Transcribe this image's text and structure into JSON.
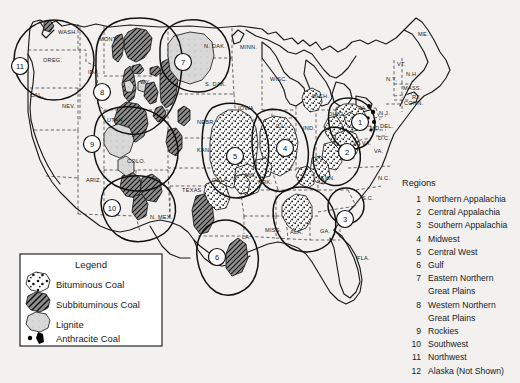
{
  "figure": {
    "kind": "coal-fields-map",
    "background_color": "#f2f1ef",
    "ink_color": "#1a1a1a"
  },
  "legend": {
    "title": "Legend",
    "items": [
      {
        "label": "Bituminous Coal",
        "swatch": "bituminous-stipple",
        "fill_color": "#ffffff"
      },
      {
        "label": "Subbituminous Coal",
        "swatch": "subbituminous-hatch",
        "fill_color": "#8c8c8c"
      },
      {
        "label": "Lignite",
        "swatch": "lignite-light",
        "fill_color": "#d6d6d6"
      },
      {
        "label": "Anthracite Coal",
        "swatch": "anthracite-dots",
        "fill_color": "#000000"
      }
    ]
  },
  "regions": {
    "title": "Regions",
    "items": [
      {
        "number": "1",
        "name": "Northern Appalachia"
      },
      {
        "number": "2",
        "name": "Central Appalachia"
      },
      {
        "number": "3",
        "name": "Southern Appalachia"
      },
      {
        "number": "4",
        "name": "Midwest"
      },
      {
        "number": "5",
        "name": "Central West"
      },
      {
        "number": "6",
        "name": "Gulf"
      },
      {
        "number": "7",
        "name": "Eastern Northern"
      },
      {
        "number": "",
        "name": "Great Plains"
      },
      {
        "number": "8",
        "name": "Western Northern"
      },
      {
        "number": "",
        "name": "Great Plains"
      },
      {
        "number": "9",
        "name": "Rockies"
      },
      {
        "number": "10",
        "name": "Southwest"
      },
      {
        "number": "11",
        "name": "Northwest"
      },
      {
        "number": "12",
        "name": "Alaska (Not Shown)"
      }
    ]
  },
  "map_badges": [
    {
      "label": "11",
      "x": 20,
      "y": 66
    },
    {
      "label": "7",
      "x": 183,
      "y": 62
    },
    {
      "label": "8",
      "x": 102,
      "y": 92
    },
    {
      "label": "1",
      "x": 360,
      "y": 122
    },
    {
      "label": "9",
      "x": 92,
      "y": 144
    },
    {
      "label": "2",
      "x": 347,
      "y": 152
    },
    {
      "label": "5",
      "x": 235,
      "y": 156
    },
    {
      "label": "4",
      "x": 285,
      "y": 148
    },
    {
      "label": "10",
      "x": 112,
      "y": 208
    },
    {
      "label": "3",
      "x": 345,
      "y": 219
    },
    {
      "label": "6",
      "x": 217,
      "y": 257
    }
  ],
  "state_labels": [
    {
      "text": "WASH.",
      "x": 58,
      "y": 34
    },
    {
      "text": "OREG.",
      "x": 43,
      "y": 62
    },
    {
      "text": "MONT.",
      "x": 99,
      "y": 41
    },
    {
      "text": "N. DAK.",
      "x": 204,
      "y": 48
    },
    {
      "text": "MINN.",
      "x": 240,
      "y": 49
    },
    {
      "text": "ME.",
      "x": 418,
      "y": 36
    },
    {
      "text": "IDA.",
      "x": 88,
      "y": 74
    },
    {
      "text": "S. DAK.",
      "x": 205,
      "y": 86
    },
    {
      "text": "WISC.",
      "x": 270,
      "y": 81
    },
    {
      "text": "N.Y.",
      "x": 386,
      "y": 81
    },
    {
      "text": "VT.",
      "x": 397,
      "y": 66
    },
    {
      "text": "N.H.",
      "x": 406,
      "y": 76
    },
    {
      "text": "MASS.",
      "x": 403,
      "y": 90
    },
    {
      "text": "R.I.",
      "x": 412,
      "y": 99
    },
    {
      "text": "CAL.",
      "x": 30,
      "y": 97
    },
    {
      "text": "NEV.",
      "x": 62,
      "y": 108
    },
    {
      "text": "WY.",
      "x": 140,
      "y": 84
    },
    {
      "text": "IOWA",
      "x": 238,
      "y": 110
    },
    {
      "text": "MICH.",
      "x": 312,
      "y": 98
    },
    {
      "text": "OHIO",
      "x": 328,
      "y": 116
    },
    {
      "text": "PA.",
      "x": 358,
      "y": 110
    },
    {
      "text": "CONN.",
      "x": 404,
      "y": 105
    },
    {
      "text": "N.J.",
      "x": 379,
      "y": 115
    },
    {
      "text": "UTAH",
      "x": 107,
      "y": 122
    },
    {
      "text": "NEBR.",
      "x": 197,
      "y": 124
    },
    {
      "text": "ILL.",
      "x": 276,
      "y": 128
    },
    {
      "text": "IND.",
      "x": 303,
      "y": 130
    },
    {
      "text": "MD.",
      "x": 370,
      "y": 130
    },
    {
      "text": "DEL.",
      "x": 380,
      "y": 128
    },
    {
      "text": "D.C.",
      "x": 378,
      "y": 140
    },
    {
      "text": "W. VA.",
      "x": 353,
      "y": 145
    },
    {
      "text": "VA.",
      "x": 374,
      "y": 153
    },
    {
      "text": "COLO.",
      "x": 127,
      "y": 163
    },
    {
      "text": "KAN.",
      "x": 197,
      "y": 152
    },
    {
      "text": "KY.",
      "x": 315,
      "y": 162
    },
    {
      "text": "N.C.",
      "x": 378,
      "y": 180
    },
    {
      "text": "ARIZ.",
      "x": 86,
      "y": 182
    },
    {
      "text": "OKLA.",
      "x": 212,
      "y": 182
    },
    {
      "text": "MO.",
      "x": 245,
      "y": 177
    },
    {
      "text": "ARK.",
      "x": 258,
      "y": 184
    },
    {
      "text": "TENN.",
      "x": 317,
      "y": 180
    },
    {
      "text": "S.C.",
      "x": 362,
      "y": 200
    },
    {
      "text": "TEXAS",
      "x": 182,
      "y": 192
    },
    {
      "text": "N. MEX.",
      "x": 150,
      "y": 219
    },
    {
      "text": "MISS.",
      "x": 265,
      "y": 232
    },
    {
      "text": "ALA.",
      "x": 290,
      "y": 234
    },
    {
      "text": "GA.",
      "x": 320,
      "y": 233
    },
    {
      "text": "LA.",
      "x": 242,
      "y": 239
    },
    {
      "text": "FLA.",
      "x": 357,
      "y": 260
    }
  ]
}
